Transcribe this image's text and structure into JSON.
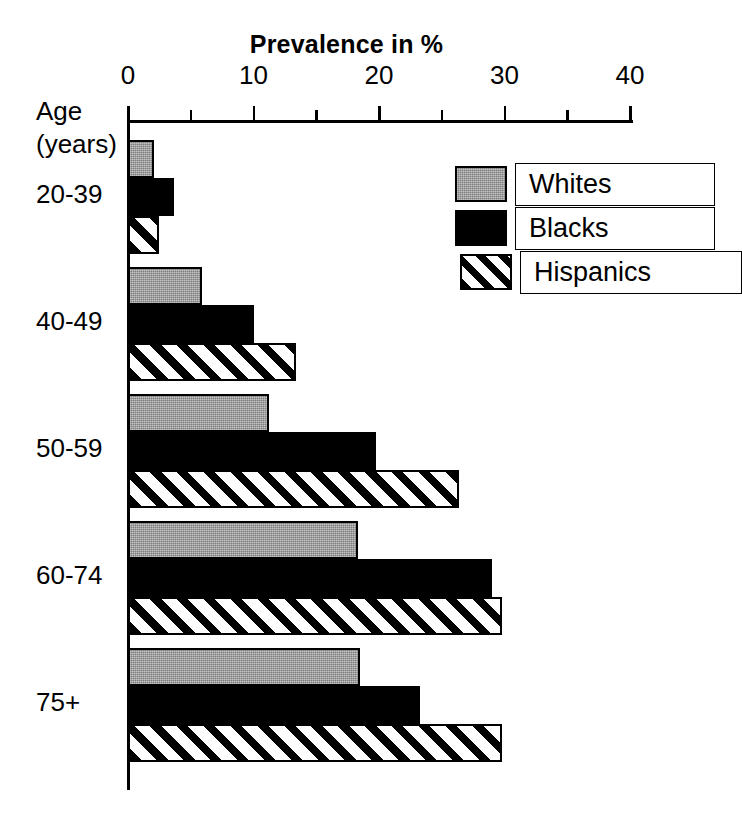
{
  "chart_data": {
    "type": "bar",
    "orientation": "horizontal",
    "title": "Prevalence in %",
    "xlabel": "Prevalence in %",
    "ylabel": "Age (years)",
    "ylabel_line1": "Age",
    "ylabel_line2": "(years)",
    "categories": [
      "20-39",
      "40-49",
      "50-59",
      "60-74",
      "75+"
    ],
    "xlim": [
      0,
      40
    ],
    "xticks": [
      0,
      10,
      20,
      30,
      40
    ],
    "xtick_labels": [
      "0",
      "10",
      "20",
      "30",
      "40"
    ],
    "xminor_ticks": [
      5,
      15,
      25,
      35
    ],
    "grid": false,
    "legend_position": "upper right",
    "series": [
      {
        "name": "Whites",
        "fill": "gray-stipple",
        "color": "#9d9d9d",
        "values": [
          2.1,
          5.9,
          11.2,
          18.3,
          18.5
        ]
      },
      {
        "name": "Blacks",
        "fill": "solid-black",
        "color": "#000000",
        "values": [
          3.7,
          10.0,
          19.8,
          29.0,
          23.3
        ]
      },
      {
        "name": "Hispanics",
        "fill": "diagonal-hatch",
        "color": "#ffffff",
        "values": [
          2.5,
          13.4,
          26.4,
          29.8,
          29.8
        ]
      }
    ]
  }
}
